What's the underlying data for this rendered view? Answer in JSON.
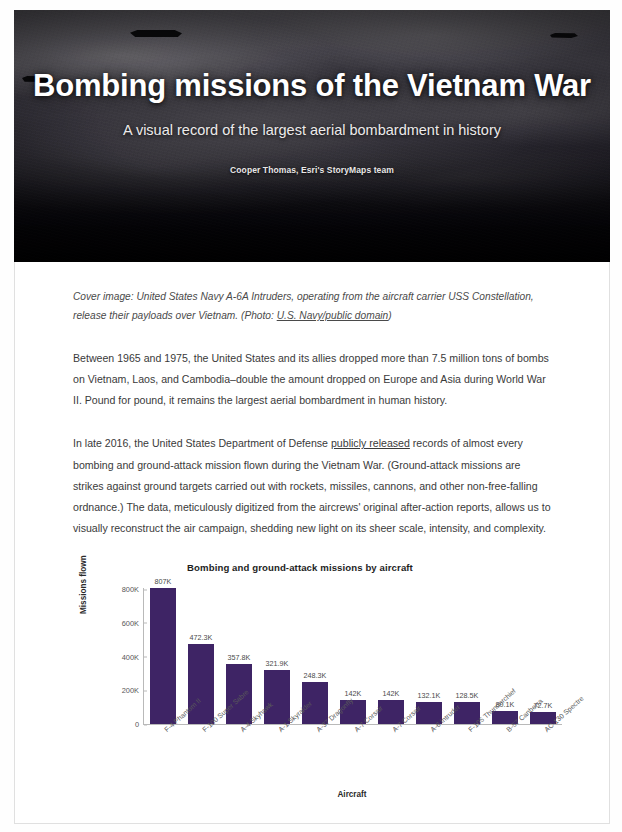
{
  "hero": {
    "title": "Bombing missions of the Vietnam War",
    "subtitle": "A visual record of the largest aerial bombardment in history",
    "byline": "Cooper Thomas, Esri's StoryMaps team"
  },
  "article": {
    "caption_pre": "Cover image: United States Navy A-6A Intruders, operating from the aircraft carrier USS Constellation, release their payloads over Vietnam. (Photo: ",
    "caption_link": "U.S. Navy/public domain",
    "caption_post": ")",
    "paragraph_1": "Between 1965 and 1975, the United States and its allies dropped more than 7.5 million tons of bombs on Vietnam, Laos, and Cambodia–double the amount dropped on Europe and Asia during World War II. Pound for pound, it remains the largest aerial bombardment in human history.",
    "paragraph_2_pre": "In late 2016, the United States Department of Defense ",
    "paragraph_2_link": "publicly released",
    "paragraph_2_post": " records of almost every bombing and ground-attack mission flown during the Vietnam War. (Ground-attack missions are strikes against ground targets carried out with rockets, missiles, cannons, and other non-free-falling ordnance.) The data, meticulously digitized from the aircrews' original after-action reports, allows us to visually reconstruct the air campaign, shedding new light on its sheer scale, intensity, and complexity."
  },
  "chart_data": {
    "type": "bar",
    "title": "Bombing and ground-attack missions by aircraft",
    "xlabel": "Aircraft",
    "ylabel": "Missions flown",
    "categories": [
      "F-4 Phantom II",
      "F-100 Super Sabre",
      "A-4 Skyhawk",
      "A-1 Skyraider",
      "A-37 Dragonfly",
      "A-7 Corsair",
      "A-7 Corsair",
      "A-6 Intruder",
      "F-105 Thunderchief",
      "B-57 Canberra",
      "AC-130 Spectre"
    ],
    "values": [
      807000,
      472300,
      357800,
      321900,
      248300,
      142000,
      142000,
      132100,
      128500,
      80100,
      72700
    ],
    "value_labels": [
      "807K",
      "472.3K",
      "357.8K",
      "321.9K",
      "248.3K",
      "142K",
      "142K",
      "132.1K",
      "128.5K",
      "80.1K",
      "72.7K"
    ],
    "ylim": [
      0,
      807000
    ],
    "yticks": [
      0,
      200000,
      400000,
      600000,
      800000
    ],
    "ytick_labels": [
      "0",
      "200K",
      "400K",
      "600K",
      "800K"
    ],
    "grid": false,
    "legend": null,
    "bar_color": "#3e2465"
  }
}
